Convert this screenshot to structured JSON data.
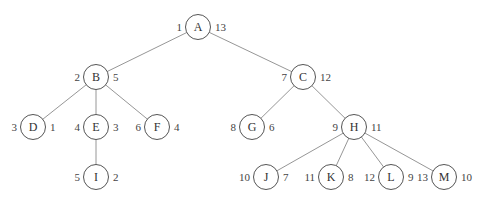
{
  "diagram": {
    "type": "tree",
    "nodes": [
      {
        "id": "A",
        "label": "A",
        "x": 198,
        "y": 27,
        "left": "1",
        "right": "13"
      },
      {
        "id": "B",
        "label": "B",
        "x": 96,
        "y": 77,
        "left": "2",
        "right": "5"
      },
      {
        "id": "C",
        "label": "C",
        "x": 303,
        "y": 77,
        "left": "7",
        "right": "12"
      },
      {
        "id": "D",
        "label": "D",
        "x": 33,
        "y": 127,
        "left": "3",
        "right": "1"
      },
      {
        "id": "E",
        "label": "E",
        "x": 96,
        "y": 127,
        "left": "4",
        "right": "3"
      },
      {
        "id": "F",
        "label": "F",
        "x": 157,
        "y": 127,
        "left": "6",
        "right": "4"
      },
      {
        "id": "G",
        "label": "G",
        "x": 252,
        "y": 127,
        "left": "8",
        "right": "6"
      },
      {
        "id": "H",
        "label": "H",
        "x": 354,
        "y": 127,
        "left": "9",
        "right": "11"
      },
      {
        "id": "I",
        "label": "I",
        "x": 96,
        "y": 177,
        "left": "5",
        "right": "2"
      },
      {
        "id": "J",
        "label": "J",
        "x": 266,
        "y": 177,
        "left": "10",
        "right": "7"
      },
      {
        "id": "K",
        "label": "K",
        "x": 331,
        "y": 177,
        "left": "11",
        "right": "8"
      },
      {
        "id": "L",
        "label": "L",
        "x": 391,
        "y": 177,
        "left": "12",
        "right": "9"
      },
      {
        "id": "M",
        "label": "M",
        "x": 444,
        "y": 177,
        "left": "13",
        "right": "10"
      }
    ],
    "edges": [
      [
        "A",
        "B"
      ],
      [
        "A",
        "C"
      ],
      [
        "B",
        "D"
      ],
      [
        "B",
        "E"
      ],
      [
        "B",
        "F"
      ],
      [
        "E",
        "I"
      ],
      [
        "C",
        "G"
      ],
      [
        "C",
        "H"
      ],
      [
        "H",
        "J"
      ],
      [
        "H",
        "K"
      ],
      [
        "H",
        "L"
      ],
      [
        "H",
        "M"
      ]
    ]
  }
}
